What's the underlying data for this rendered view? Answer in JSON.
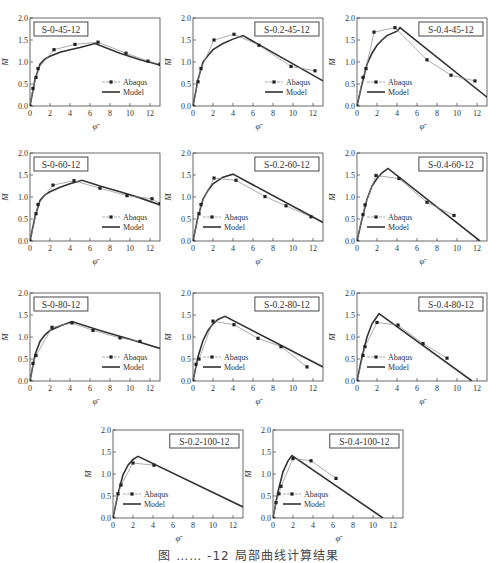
{
  "caption": "图 …… -12 局部曲线计算结果",
  "chart_data": [
    {
      "type": "line",
      "title": "S-0-45-12",
      "xlabel": "φ̄",
      "ylabel": "M̄",
      "xlim": [
        0,
        13
      ],
      "ylim": [
        0,
        2
      ],
      "xticks": [
        0,
        2,
        4,
        6,
        8,
        10,
        12
      ],
      "yticks": [
        0.0,
        0.5,
        1.0,
        1.5,
        2.0
      ],
      "legend": [
        "Abaqus",
        "Model"
      ],
      "title_pos": "left",
      "legend_pos": "right",
      "series": [
        {
          "name": "Abaqus",
          "x": [
            0,
            0.3,
            0.6,
            0.8,
            2.4,
            4.5,
            6.8,
            9.6,
            11.8,
            13
          ],
          "y": [
            0,
            0.4,
            0.65,
            0.85,
            1.28,
            1.4,
            1.45,
            1.2,
            1.02,
            0.95
          ]
        },
        {
          "name": "Model",
          "x": [
            0,
            0.5,
            1,
            1.5,
            2,
            3,
            4,
            5,
            6.5,
            9,
            11,
            13
          ],
          "y": [
            0,
            0.6,
            0.95,
            1.07,
            1.13,
            1.22,
            1.28,
            1.33,
            1.42,
            1.2,
            1.05,
            0.93
          ]
        }
      ]
    },
    {
      "type": "line",
      "title": "S-0.2-45-12",
      "xlabel": "φ̄",
      "ylabel": "M̄",
      "xlim": [
        0,
        13
      ],
      "ylim": [
        0,
        2
      ],
      "xticks": [
        0,
        2,
        4,
        6,
        8,
        10,
        12
      ],
      "yticks": [
        0.0,
        0.5,
        1.0,
        1.5,
        2.0
      ],
      "legend": [
        "Abaqus",
        "Model"
      ],
      "title_pos": "right",
      "legend_pos": "right",
      "series": [
        {
          "name": "Abaqus",
          "x": [
            0,
            0.5,
            0.8,
            2.1,
            4.1,
            6.6,
            9.8,
            12.2
          ],
          "y": [
            0,
            0.55,
            0.85,
            1.5,
            1.63,
            1.38,
            0.9,
            0.8
          ]
        },
        {
          "name": "Model",
          "x": [
            0,
            0.5,
            1,
            1.5,
            2,
            3,
            4,
            5,
            13
          ],
          "y": [
            0,
            0.6,
            1.0,
            1.15,
            1.28,
            1.42,
            1.52,
            1.6,
            0.57
          ]
        }
      ]
    },
    {
      "type": "line",
      "title": "S-0.4-45-12",
      "xlabel": "φ̄",
      "ylabel": "M̄",
      "xlim": [
        0,
        13
      ],
      "ylim": [
        0,
        2
      ],
      "xticks": [
        0,
        2,
        4,
        6,
        8,
        10,
        12
      ],
      "yticks": [
        0.0,
        0.5,
        1.0,
        1.5,
        2.0
      ],
      "legend": [
        "Abaqus",
        "Model"
      ],
      "title_pos": "right",
      "legend_pos": "left",
      "series": [
        {
          "name": "Abaqus",
          "x": [
            0,
            0.6,
            0.9,
            1.7,
            3.8,
            7,
            9.4,
            11.8
          ],
          "y": [
            0,
            0.65,
            0.85,
            1.68,
            1.78,
            1.05,
            0.7,
            0.57
          ]
        },
        {
          "name": "Model",
          "x": [
            0,
            0.5,
            1,
            1.5,
            2,
            2.5,
            3,
            4,
            4.3,
            13
          ],
          "y": [
            0,
            0.5,
            0.95,
            1.2,
            1.38,
            1.5,
            1.6,
            1.7,
            1.78,
            0.2
          ]
        }
      ]
    },
    {
      "type": "line",
      "title": "S-0-60-12",
      "xlabel": "φ̄",
      "ylabel": "M̄",
      "xlim": [
        0,
        13
      ],
      "ylim": [
        0,
        2
      ],
      "xticks": [
        0,
        2,
        4,
        6,
        8,
        10,
        12
      ],
      "yticks": [
        0.0,
        0.5,
        1.0,
        1.5,
        2.0
      ],
      "legend": [
        "Abaqus",
        "Model"
      ],
      "title_pos": "left",
      "legend_pos": "right",
      "series": [
        {
          "name": "Abaqus",
          "x": [
            0,
            0.6,
            0.8,
            2.3,
            4.4,
            7,
            9.7,
            12.2,
            13
          ],
          "y": [
            0,
            0.62,
            0.83,
            1.27,
            1.37,
            1.2,
            1.03,
            0.96,
            0.85
          ]
        },
        {
          "name": "Model",
          "x": [
            0,
            0.5,
            1,
            1.5,
            2,
            3,
            4,
            5.2,
            7,
            9,
            11,
            13
          ],
          "y": [
            0,
            0.55,
            0.92,
            1.05,
            1.12,
            1.22,
            1.3,
            1.38,
            1.25,
            1.12,
            0.98,
            0.82
          ]
        }
      ]
    },
    {
      "type": "line",
      "title": "S-0.2-60-12",
      "xlabel": "φ̄",
      "ylabel": "M̄",
      "xlim": [
        0,
        13
      ],
      "ylim": [
        0,
        2
      ],
      "xticks": [
        0,
        2,
        4,
        6,
        8,
        10,
        12
      ],
      "yticks": [
        0.0,
        0.5,
        1.0,
        1.5,
        2.0
      ],
      "legend": [
        "Abaqus",
        "Model"
      ],
      "title_pos": "right",
      "legend_pos": "left",
      "series": [
        {
          "name": "Abaqus",
          "x": [
            0,
            0.6,
            0.8,
            2.1,
            4.3,
            7.2,
            9.3,
            11.8
          ],
          "y": [
            0,
            0.62,
            0.83,
            1.43,
            1.38,
            1.01,
            0.8,
            0.55
          ]
        },
        {
          "name": "Model",
          "x": [
            0,
            0.5,
            1,
            1.5,
            2,
            3,
            4,
            13
          ],
          "y": [
            0,
            0.55,
            0.95,
            1.15,
            1.3,
            1.45,
            1.52,
            0.42
          ]
        }
      ]
    },
    {
      "type": "line",
      "title": "S-0.4-60-12",
      "xlabel": "φ̄",
      "ylabel": "M̄",
      "xlim": [
        0,
        13
      ],
      "ylim": [
        0,
        2
      ],
      "xticks": [
        0,
        2,
        4,
        6,
        8,
        10,
        12
      ],
      "yticks": [
        0.0,
        0.5,
        1.0,
        1.5,
        2.0
      ],
      "legend": [
        "Abaqus",
        "Model"
      ],
      "title_pos": "right",
      "legend_pos": "left",
      "series": [
        {
          "name": "Abaqus",
          "x": [
            0,
            0.6,
            0.8,
            1.9,
            4.2,
            7,
            9.7
          ],
          "y": [
            0,
            0.6,
            0.82,
            1.49,
            1.42,
            0.88,
            0.58
          ]
        },
        {
          "name": "Model",
          "x": [
            0,
            0.5,
            1,
            1.5,
            2,
            2.5,
            3.1,
            12.3
          ],
          "y": [
            0,
            0.5,
            0.95,
            1.25,
            1.42,
            1.55,
            1.65,
            0
          ]
        }
      ]
    },
    {
      "type": "line",
      "title": "S-0-80-12",
      "xlabel": "φ̄",
      "ylabel": "M̄",
      "xlim": [
        0,
        13
      ],
      "ylim": [
        0,
        2
      ],
      "xticks": [
        0,
        2,
        4,
        6,
        8,
        10,
        12
      ],
      "yticks": [
        0.0,
        0.5,
        1.0,
        1.5,
        2.0
      ],
      "legend": [
        "Abaqus",
        "Model"
      ],
      "title_pos": "left",
      "legend_pos": "right",
      "series": [
        {
          "name": "Abaqus",
          "x": [
            0,
            0.3,
            0.6,
            2.2,
            4.2,
            6.3,
            9,
            11
          ],
          "y": [
            0,
            0.4,
            0.58,
            1.22,
            1.32,
            1.15,
            0.98,
            0.9
          ]
        },
        {
          "name": "Model",
          "x": [
            0,
            0.5,
            1,
            1.5,
            2,
            3,
            4.2,
            7,
            10,
            13
          ],
          "y": [
            0,
            0.6,
            0.9,
            1.05,
            1.15,
            1.25,
            1.35,
            1.15,
            0.95,
            0.74
          ]
        }
      ]
    },
    {
      "type": "line",
      "title": "S-0.2-80-12",
      "xlabel": "φ̄",
      "ylabel": "M̄",
      "xlim": [
        0,
        13
      ],
      "ylim": [
        0,
        2
      ],
      "xticks": [
        0,
        2,
        4,
        6,
        8,
        10,
        12
      ],
      "yticks": [
        0.0,
        0.5,
        1.0,
        1.5,
        2.0
      ],
      "legend": [
        "Abaqus",
        "Model"
      ],
      "title_pos": "right",
      "legend_pos": "left",
      "series": [
        {
          "name": "Abaqus",
          "x": [
            0,
            0.3,
            0.6,
            2,
            4.1,
            6.5,
            8.8,
            11.4
          ],
          "y": [
            0,
            0.38,
            0.5,
            1.36,
            1.28,
            0.97,
            0.78,
            0.32
          ]
        },
        {
          "name": "Model",
          "x": [
            0,
            0.5,
            1,
            1.5,
            2,
            2.5,
            3.2,
            13
          ],
          "y": [
            0,
            0.55,
            0.92,
            1.15,
            1.3,
            1.4,
            1.47,
            0.32
          ]
        }
      ]
    },
    {
      "type": "line",
      "title": "S-0.4-80-12",
      "xlabel": "φ̄",
      "ylabel": "M̄",
      "xlim": [
        0,
        13
      ],
      "ylim": [
        0,
        2
      ],
      "xticks": [
        0,
        2,
        4,
        6,
        8,
        10,
        12
      ],
      "yticks": [
        0.0,
        0.5,
        1.0,
        1.5,
        2.0
      ],
      "legend": [
        "Abaqus",
        "Model"
      ],
      "title_pos": "right",
      "legend_pos": "left",
      "series": [
        {
          "name": "Abaqus",
          "x": [
            0,
            0.6,
            0.8,
            2,
            4.1,
            6.6,
            9
          ],
          "y": [
            0,
            0.58,
            0.78,
            1.33,
            1.27,
            0.85,
            0.52
          ]
        },
        {
          "name": "Model",
          "x": [
            0,
            0.5,
            1,
            1.5,
            2.2,
            11.5
          ],
          "y": [
            0,
            0.55,
            1.0,
            1.3,
            1.53,
            0
          ]
        }
      ]
    },
    {
      "type": "line",
      "title": "S-0.2-100-12",
      "xlabel": "φ̄",
      "ylabel": "M̄",
      "xlim": [
        0,
        13
      ],
      "ylim": [
        0,
        2
      ],
      "xticks": [
        0,
        2,
        4,
        6,
        8,
        10,
        12
      ],
      "yticks": [
        0.0,
        0.5,
        1.0,
        1.5,
        2.0
      ],
      "legend": [
        "Abaqus",
        "Model"
      ],
      "title_pos": "right",
      "legend_pos": "left",
      "series": [
        {
          "name": "Abaqus",
          "x": [
            0,
            0.5,
            0.8,
            2,
            4.1
          ],
          "y": [
            0,
            0.55,
            0.75,
            1.25,
            1.2
          ]
        },
        {
          "name": "Model",
          "x": [
            0,
            0.5,
            1,
            1.5,
            2,
            2.5,
            13
          ],
          "y": [
            0,
            0.55,
            0.98,
            1.2,
            1.33,
            1.4,
            0.25
          ]
        }
      ]
    },
    {
      "type": "line",
      "title": "S-0.4-100-12",
      "xlabel": "φ̄",
      "ylabel": "M̄",
      "xlim": [
        0,
        13
      ],
      "ylim": [
        0,
        2
      ],
      "xticks": [
        0,
        2,
        4,
        6,
        8,
        10,
        12
      ],
      "yticks": [
        0.0,
        0.5,
        1.0,
        1.5,
        2.0
      ],
      "legend": [
        "Abaqus",
        "Model"
      ],
      "title_pos": "right",
      "legend_pos": "left",
      "series": [
        {
          "name": "Abaqus",
          "x": [
            0,
            0.3,
            0.6,
            0.8,
            2,
            3.8,
            6.3
          ],
          "y": [
            0,
            0.35,
            0.55,
            0.72,
            1.35,
            1.3,
            0.9
          ]
        },
        {
          "name": "Model",
          "x": [
            0,
            0.5,
            1,
            1.5,
            1.9,
            11
          ],
          "y": [
            0,
            0.6,
            1.05,
            1.3,
            1.42,
            0
          ]
        }
      ]
    }
  ],
  "layout": [
    {
      "left": 0,
      "top": 8
    },
    {
      "left": 163,
      "top": 8
    },
    {
      "left": 327,
      "top": 8
    },
    {
      "left": 0,
      "top": 143
    },
    {
      "left": 163,
      "top": 143
    },
    {
      "left": 327,
      "top": 143
    },
    {
      "left": 0,
      "top": 283
    },
    {
      "left": 163,
      "top": 283
    },
    {
      "left": 327,
      "top": 283
    },
    {
      "left": 83,
      "top": 420
    },
    {
      "left": 243,
      "top": 420
    }
  ]
}
